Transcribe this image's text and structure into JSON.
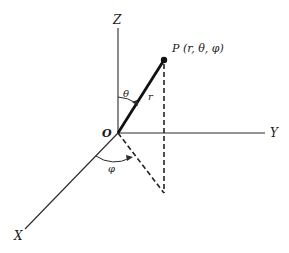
{
  "diagram": {
    "axes": {
      "z_label": "Z",
      "y_label": "Y",
      "x_label": "X"
    },
    "origin_label": "O",
    "point": {
      "label": "P (r, θ, φ)"
    },
    "radius_label": "r",
    "angles": {
      "theta_label": "θ",
      "phi_label": "φ"
    },
    "colors": {
      "ink": "#1a1a1a",
      "background": "#ffffff"
    }
  }
}
